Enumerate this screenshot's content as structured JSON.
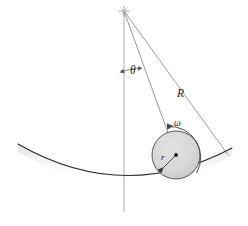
{
  "figure": {
    "background_color": "#ffffff",
    "labels": {
      "theta": "θ",
      "big_r": "R",
      "omega": "ω",
      "small_r": "r"
    },
    "label_names": {
      "theta": "angle-theta-label",
      "big_r": "radius-R-label",
      "omega": "angular-velocity-omega-label",
      "small_r": "radius-r-label"
    },
    "colors": {
      "disk_fill": "#d6d6d6",
      "disk_stroke": "#4a4a4a",
      "curve_stroke": "#2b2b2b",
      "guide_stroke": "#8f8f8f",
      "label_text": "#1a1a1a",
      "shadow": "#e8e8e8"
    },
    "geometry": {
      "pivot": {
        "x": 124,
        "y": 11,
        "marker": "cross"
      },
      "vertical_line": {
        "x": 124,
        "y_top": 11,
        "y_bottom": 212
      },
      "disk": {
        "cx": 176,
        "cy": 155,
        "r": 24
      },
      "R_line": {
        "x1": 124,
        "y1": 11,
        "x2": 228,
        "y2": 155
      },
      "R_outer_line": {
        "x1": 124,
        "y1": 11,
        "x2": 232,
        "y2": 149
      },
      "bowl_curve": {
        "x_left": 18,
        "y_left": 144,
        "x_bottom": 124,
        "y_bottom": 183,
        "x_right": 232,
        "y_right": 148
      },
      "theta_arc": {
        "cx": 124,
        "cy": 11,
        "radius": 60,
        "from_deg": 0,
        "to_deg": 14
      },
      "omega_arc": {
        "cx": 176,
        "cy": 155,
        "radius": 31,
        "direction": "counterclockwise"
      },
      "r_arrow": {
        "x1": 176,
        "y1": 155,
        "x2": 159,
        "y2": 172
      }
    },
    "elements": [
      {
        "name": "pivot-marker",
        "type": "cross"
      },
      {
        "name": "vertical-reference-line",
        "type": "line"
      },
      {
        "name": "radius-R-line",
        "type": "line"
      },
      {
        "name": "radius-R-outer-line",
        "type": "line"
      },
      {
        "name": "bowl-surface-curve",
        "type": "path"
      },
      {
        "name": "rolling-disk",
        "type": "circle"
      },
      {
        "name": "disk-center-dot",
        "type": "dot"
      },
      {
        "name": "radius-r-arrow",
        "type": "arrow"
      },
      {
        "name": "angle-theta-arc",
        "type": "arc"
      },
      {
        "name": "angular-velocity-omega-arc",
        "type": "arc"
      }
    ]
  }
}
